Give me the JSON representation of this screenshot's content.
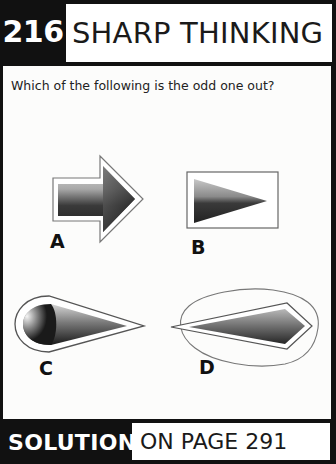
{
  "header": {
    "puzzle_number": "216",
    "title": "SHARP THINKING"
  },
  "question": "Which of the following is the odd one out?",
  "options": [
    {
      "label": "A",
      "shape": "arrow-in-arrow-outline"
    },
    {
      "label": "B",
      "shape": "triangle-in-rectangle"
    },
    {
      "label": "C",
      "shape": "teardrop-in-teardrop-outline"
    },
    {
      "label": "D",
      "shape": "kite-in-freeform-loop"
    }
  ],
  "footer": {
    "solution_label": "SOLUTION",
    "page_ref": "ON PAGE 291"
  },
  "colors": {
    "frame": "#111111",
    "panel": "#fcfcfb",
    "text": "#1a1a1a"
  }
}
